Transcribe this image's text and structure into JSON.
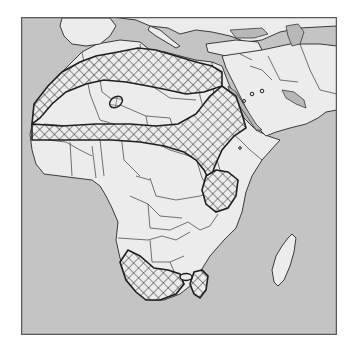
{
  "map": {
    "title": "",
    "region": "Africa and Arabian Peninsula",
    "colors": {
      "sea": "#c4c4c4",
      "land": "#ececec",
      "inland_water": "#b8b8b8",
      "border": "#3a3a3a",
      "frame": "#5a5a5a",
      "hatch_stroke": "#2e2e2e",
      "zone_outline": "#1e1e1e"
    },
    "frame": {
      "x": 21,
      "y": 17,
      "width": 316,
      "height": 318
    },
    "land_shapes": [
      {
        "name": "africa",
        "d": "M97,44 L120,40 L140,42 L150,50 L165,52 L180,56 L196,60 L212,62 L222,66 L228,82 L236,100 L244,118 L256,130 L268,136 L280,140 L262,160 L252,176 L246,192 L242,212 L236,228 L224,240 L210,256 L200,272 L190,286 L180,294 L164,300 L150,300 L138,292 L128,276 L120,258 L116,240 L118,222 L112,208 L106,196 L100,186 L92,180 L76,178 L60,176 L44,174 L36,164 L32,150 L30,134 L34,118 L40,102 L48,88 L58,76 L70,64 L82,52 Z"
      },
      {
        "name": "iberia",
        "d": "M62,18 L110,18 L116,26 L110,36 L100,44 L86,46 L72,44 L64,36 L60,26 Z"
      },
      {
        "name": "europe-east",
        "d": "M112,17 L337,17 L337,26 L300,28 L280,32 L262,40 L246,42 L230,36 L212,32 L196,30 L180,34 L168,28 L150,26 L136,20 Z"
      },
      {
        "name": "italy",
        "d": "M150,26 L160,30 L172,40 L180,46 L176,48 L166,42 L156,36 L148,30 Z"
      },
      {
        "name": "anatolia",
        "d": "M206,44 L236,40 L258,42 L262,50 L248,56 L226,56 L208,52 Z"
      },
      {
        "name": "middle-east",
        "d": "M222,56 L262,50 L290,44 L320,44 L337,46 L337,110 L326,112 L318,118 L306,124 L290,128 L276,132 L266,136 L258,128 L250,116 L244,104 L238,92 L232,80 L226,68 Z"
      },
      {
        "name": "madagascar",
        "d": "M288,238 L292,234 L296,238 L294,252 L290,266 L284,280 L278,286 L274,282 L272,270 L276,256 L282,246 Z"
      }
    ],
    "inland_water": [
      {
        "name": "caspian-sea",
        "d": "M286,26 L298,24 L304,32 L300,44 L292,46 L288,36 Z"
      },
      {
        "name": "black-sea",
        "d": "M230,30 L262,28 L268,34 L254,38 L236,38 Z"
      },
      {
        "name": "persian-gulf",
        "d": "M282,90 L294,92 L304,100 L306,108 L296,104 L286,98 Z"
      },
      {
        "name": "red-sea",
        "d": "M228,86 L236,92 L246,108 L256,124 L262,130 L256,130 L248,118 L238,104 L230,94 Z"
      },
      {
        "name": "lake-victoria",
        "d": "M222,190 L230,188 L232,196 L224,198 Z"
      }
    ],
    "borders": [
      "M82,52 L90,94 L100,120 L120,126",
      "M96,56 L102,92 L118,104 L146,116 L170,118",
      "M140,44 L146,82 L170,98 L196,100",
      "M196,60 L200,96 L206,118",
      "M212,62 L214,100",
      "M44,124 L70,126 L84,130 L100,128",
      "M48,140 L66,142 L80,150 L92,156",
      "M70,142 L72,176",
      "M92,146 L96,178",
      "M100,140 L104,176",
      "M120,126 L124,160 L140,176",
      "M146,116 L150,140 L170,150 L196,158",
      "M170,118 L176,138 L196,146 L214,150",
      "M206,118 L226,128 L240,140",
      "M150,178 L156,196 L176,200 L200,196 L224,186",
      "M136,176 L150,180",
      "M130,196 L148,204 L160,216 L182,218",
      "M148,204 L150,228 L170,230 L188,222",
      "M118,238 L148,240 L162,236 L176,240 L190,232",
      "M150,240 L152,262 L170,262 L184,256",
      "M196,158 L202,178 L210,190",
      "M214,150 L220,170 L234,176",
      "M240,140 L250,150 L262,160",
      "M188,222 L200,230 L210,226 L218,214",
      "M170,262 L176,276 L190,278",
      "M268,56 L280,80 L298,82",
      "M250,66 L262,70 L272,80",
      "M240,54 L252,60",
      "M300,44 L310,70 L320,90 L337,94"
    ],
    "hatched_zones": [
      {
        "name": "north-africa-arid-belt",
        "d": "M34,104 L48,86 L62,72 L80,62 L96,56 L118,52 L138,48 L156,50 L176,56 L196,62 L212,66 L222,72 L222,86 L204,92 L186,94 L168,90 L148,86 L126,82 L104,80 L86,84 L66,92 L52,104 L40,118 L32,124 Z"
      },
      {
        "name": "sahel-belt",
        "d": "M32,124 L62,126 L96,124 L130,124 L156,126 L178,124 L196,114 L210,96 L222,86 L236,96 L242,114 L246,128 L234,136 L222,150 L214,168 L210,182 L204,170 L196,160 L184,152 L164,146 L140,142 L112,140 L84,140 L56,140 L32,140 Z"
      },
      {
        "name": "east-africa-zone",
        "d": "M206,176 L216,170 L228,172 L238,180 L236,196 L228,208 L216,212 L206,204 L202,190 Z"
      },
      {
        "name": "namib-kalahari-zone",
        "d": "M120,262 L128,250 L140,256 L154,268 L168,270 L180,274 L184,284 L176,294 L160,300 L146,300 L136,292 L126,280 Z"
      },
      {
        "name": "southeast-zone",
        "d": "M194,272 L202,270 L208,276 L206,290 L200,298 L194,294 L190,284 Z"
      }
    ],
    "outlined_zones": [
      {
        "name": "hoggar-ellipse",
        "cx": 116,
        "cy": 102,
        "rx": 7,
        "ry": 5,
        "rotate": -35,
        "hatched": true
      },
      {
        "name": "kalahari-ellipse",
        "cx": 186,
        "cy": 277,
        "rx": 6,
        "ry": 3.5,
        "rotate": 0,
        "hatched": false
      }
    ],
    "dots": [
      {
        "name": "arabia-dot-1",
        "cx": 252,
        "cy": 94,
        "r": 1.8
      },
      {
        "name": "arabia-dot-2",
        "cx": 262,
        "cy": 91,
        "r": 1.8
      },
      {
        "name": "arabia-dot-3",
        "cx": 244,
        "cy": 101,
        "r": 1.5
      },
      {
        "name": "ethiopia-dot",
        "cx": 240,
        "cy": 148,
        "r": 1.3
      }
    ]
  }
}
